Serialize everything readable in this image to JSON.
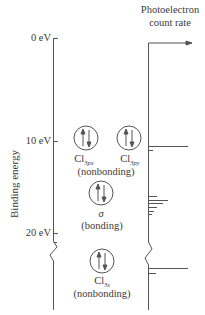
{
  "header": {
    "title_line1": "Photoelectron",
    "title_line2": "count rate"
  },
  "axis": {
    "ylabel": "Binding energy",
    "ticks": [
      "0 eV",
      "10 eV",
      "20 eV"
    ]
  },
  "orbitals": [
    {
      "name": "Cl",
      "subscript": "3p",
      "subsub": "x",
      "group": "nonbonding"
    },
    {
      "name": "Cl",
      "subscript": "3p",
      "subsub": "y",
      "group": "nonbonding"
    },
    {
      "name": "σ",
      "group": "bonding"
    },
    {
      "name": "Cl",
      "subscript": "3s",
      "group": "nonbonding"
    }
  ],
  "labels": {
    "nonbonding_p": "(nonbonding)",
    "sigma": "σ",
    "bonding": "(bonding)",
    "nonbonding_s": "(nonbonding)",
    "cl": "Cl",
    "sub_3px": "3px",
    "sub_3py": "3py",
    "sub_3s": "3s"
  },
  "spectrum": {
    "peaks": [
      {
        "energy_eV": 11.5,
        "relative_width": 1.0
      },
      {
        "energy_eV": 12.0,
        "relative_width": 0.25
      },
      {
        "energy_eV": 16.6,
        "relative_width": 0.45
      },
      {
        "energy_eV": 17.0,
        "relative_width": 0.75
      },
      {
        "energy_eV": 17.4,
        "relative_width": 0.6
      },
      {
        "energy_eV": 17.8,
        "relative_width": 0.4
      },
      {
        "energy_eV": 18.2,
        "relative_width": 0.25
      },
      {
        "energy_eV": 18.6,
        "relative_width": 0.15
      },
      {
        "energy_eV": 25.0,
        "relative_width": 1.0
      },
      {
        "energy_eV": 25.6,
        "relative_width": 0.3
      }
    ]
  }
}
